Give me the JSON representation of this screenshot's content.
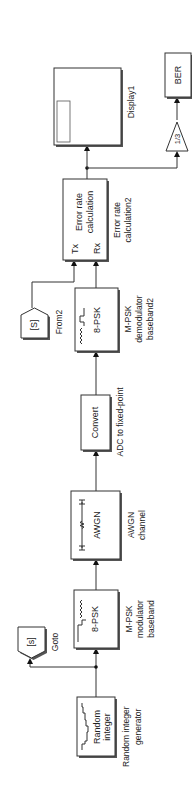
{
  "diagram": {
    "type": "Simulink model",
    "orientation": "rotated 90° counter-clockwise (signal flows bottom to top)",
    "blocks": {
      "random_integer": {
        "text_line1": "Random",
        "text_line2": "integer",
        "label_line1": "Random integer",
        "label_line2": "generator"
      },
      "goto": {
        "tag": "[s]",
        "label": "Goto"
      },
      "modulator": {
        "text": "8-PSK",
        "label_line1": "M-PSK",
        "label_line2": "modulator",
        "label_line3": "baseband"
      },
      "awgn": {
        "text": "AWGN",
        "label_line1": "AWGN",
        "label_line2": "channel"
      },
      "convert": {
        "text": "Convert",
        "label": "ADC to fixed-point"
      },
      "from": {
        "tag": "[S]",
        "label": "From2"
      },
      "demodulator": {
        "text": "8-PSK",
        "label_line1": "M-PSK",
        "label_line2": "demodulator",
        "label_line3": "baseband2"
      },
      "error_rate": {
        "text_line1": "Error rate",
        "text_line2": "calculation",
        "port_tx": "Tx",
        "port_rx": "Rx",
        "label_line1": "Error rate",
        "label_line2": "calculation2"
      },
      "display": {
        "label": "Display1"
      },
      "gain": {
        "text": "1/3"
      },
      "ber": {
        "text": "BER"
      }
    },
    "connections": [
      "Random integer generator -> M-PSK modulator baseband",
      "Random integer generator -> Goto [s]",
      "M-PSK modulator baseband -> AWGN channel",
      "AWGN channel -> ADC to fixed-point",
      "ADC to fixed-point -> M-PSK demodulator baseband2",
      "From2 [S] -> Error rate calculation2 (Tx)",
      "M-PSK demodulator baseband2 -> Error rate calculation2 (Rx)",
      "Error rate calculation2 -> Display1",
      "Error rate calculation2 -> Gain 1/3",
      "Gain 1/3 -> BER"
    ]
  }
}
